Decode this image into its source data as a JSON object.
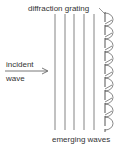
{
  "diagram": {
    "title_label": "diffraction grating",
    "incident_label_line1": "incident",
    "incident_label_line2": "wave",
    "bottom_label": "emerging waves",
    "wavefront_count": 5,
    "emerging_wavelet_count": 9,
    "colors": {
      "line": "#555555",
      "text": "#333333"
    }
  }
}
